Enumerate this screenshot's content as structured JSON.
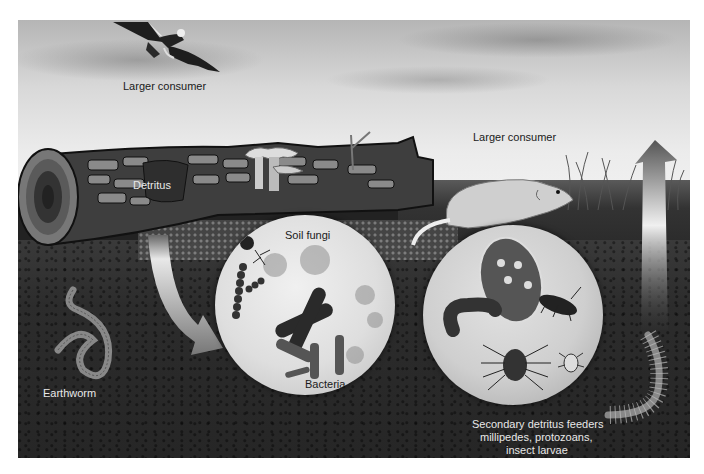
{
  "figure": {
    "color_scheme": "grayscale",
    "colors": {
      "sky_light": "#f2f2f2",
      "sky_dark": "#b5b5b5",
      "soil": "#2c2c2c",
      "log": "#3e3e3e",
      "log_bark_highlight": "#9a9a9a",
      "circle_fill": "#e0e0e0",
      "arrow": "#d8d8d8",
      "label_dark": "#1a1a1a",
      "label_light": "#e8e8e8"
    }
  },
  "labels": {
    "bird": "Larger consumer",
    "rodent": "Larger consumer",
    "detritus": "Detritus",
    "soil_fungi": "Soil fungi",
    "bacteria": "Bacteria",
    "earthworm": "Earthworm",
    "secondary_line1": "Secondary detritus feeders",
    "secondary_line2": "millipedes, protozoans,",
    "secondary_line3": "insect larvae"
  },
  "elements": {
    "bird": "bird-of-prey-icon",
    "rodent": "rodent-icon",
    "log": "fallen-log",
    "mushrooms": "mushroom-cluster-icon",
    "earthworm": "earthworm-icon",
    "centipede": "centipede-icon",
    "curved_arrow": "curved-arrow-down",
    "up_arrow": "arrow-up",
    "microbe_inset": [
      "soil-fungi",
      "bacteria-rods",
      "bacteria-chain"
    ],
    "feeder_inset": [
      "protozoan",
      "millipede",
      "beetle-larva",
      "mite",
      "beetle"
    ]
  }
}
